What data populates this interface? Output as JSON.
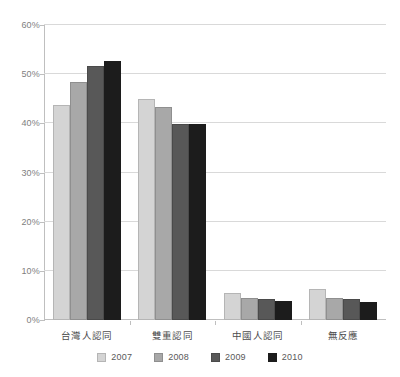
{
  "chart_data": {
    "type": "bar",
    "title": "",
    "subtitle": "",
    "xlabel": "",
    "ylabel": "",
    "categories": [
      "台灣人認同",
      "雙重認同",
      "中國人認同",
      "無反應"
    ],
    "series": [
      {
        "name": "2007",
        "color": "#d4d4d4",
        "values": [
          43.8,
          45.0,
          5.5,
          6.3
        ]
      },
      {
        "name": "2008",
        "color": "#a8a8a8",
        "values": [
          48.5,
          43.3,
          4.4,
          4.5
        ]
      },
      {
        "name": "2009",
        "color": "#585858",
        "values": [
          51.6,
          39.9,
          4.3,
          4.3
        ]
      },
      {
        "name": "2010",
        "color": "#1c1c1c",
        "values": [
          52.7,
          39.9,
          3.9,
          3.7
        ]
      }
    ],
    "ylim": [
      0,
      60
    ],
    "y_ticks": [
      0,
      10,
      20,
      30,
      40,
      50,
      60
    ],
    "y_tick_labels": [
      "0%",
      "10%",
      "20%",
      "30%",
      "40%",
      "50%",
      "60%"
    ],
    "grid": true,
    "legend_position": "bottom",
    "legend_entries": [
      "2007",
      "2008",
      "2009",
      "2010"
    ]
  }
}
